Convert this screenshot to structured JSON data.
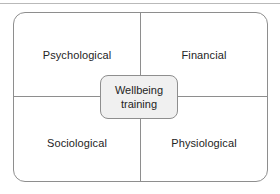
{
  "diagram": {
    "type": "quadrant-model",
    "center": {
      "line1": "Wellbeing",
      "line2": "training",
      "fill_color": "#f0f0f0",
      "border_color": "#8e8e8e"
    },
    "quadrants": [
      {
        "position": "top-left",
        "label": "Psychological"
      },
      {
        "position": "top-right",
        "label": "Financial"
      },
      {
        "position": "bottom-left",
        "label": "Sociological"
      },
      {
        "position": "bottom-right",
        "label": "Physiological"
      }
    ],
    "colors": {
      "background": "#ffffff",
      "line": "#8e8e8e",
      "top_rule": "#b9b9b9",
      "text": "#242424"
    }
  }
}
